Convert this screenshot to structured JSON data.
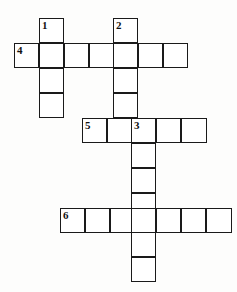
{
  "puzzle": {
    "title": "Crossword Grid",
    "type": "crossword",
    "canvas": {
      "width": 237,
      "height": 292
    },
    "cell_size": 24.8,
    "colors": {
      "grid_line": "#1a1a1a",
      "cell_fill": "#ffffff",
      "page_background": "#fdfdfc",
      "number_color": "#111111"
    },
    "entries": [
      {
        "number": "1",
        "direction": "down",
        "length": 4,
        "start": {
          "x": 39,
          "y": 18
        }
      },
      {
        "number": "2",
        "direction": "down",
        "length": 4,
        "start": {
          "x": 113,
          "y": 18
        }
      },
      {
        "number": "3",
        "direction": "down",
        "length": 7,
        "start": {
          "x": 131,
          "y": 118
        }
      },
      {
        "number": "4",
        "direction": "across",
        "length": 7,
        "start": {
          "x": 14,
          "y": 43
        }
      },
      {
        "number": "5",
        "direction": "across",
        "length": 5,
        "start": {
          "x": 82,
          "y": 118
        }
      },
      {
        "number": "6",
        "direction": "across",
        "length": 7,
        "start": {
          "x": 60,
          "y": 208
        }
      }
    ],
    "cells": [
      {
        "id": "c1",
        "x": 39,
        "y": 18,
        "w": 25,
        "h": 25,
        "number": "1"
      },
      {
        "id": "c2",
        "x": 39,
        "y": 43,
        "w": 25,
        "h": 25,
        "number": ""
      },
      {
        "id": "c3",
        "x": 39,
        "y": 68,
        "w": 25,
        "h": 25,
        "number": ""
      },
      {
        "id": "c4",
        "x": 39,
        "y": 93,
        "w": 25,
        "h": 25,
        "number": ""
      },
      {
        "id": "c5",
        "x": 113,
        "y": 18,
        "w": 25,
        "h": 25,
        "number": "2"
      },
      {
        "id": "c6",
        "x": 113,
        "y": 43,
        "w": 25,
        "h": 25,
        "number": ""
      },
      {
        "id": "c7",
        "x": 113,
        "y": 68,
        "w": 25,
        "h": 25,
        "number": ""
      },
      {
        "id": "c8",
        "x": 113,
        "y": 93,
        "w": 25,
        "h": 25,
        "number": ""
      },
      {
        "id": "c9",
        "x": 14,
        "y": 43,
        "w": 25,
        "h": 25,
        "number": "4"
      },
      {
        "id": "c10",
        "x": 64,
        "y": 43,
        "w": 25,
        "h": 25,
        "number": ""
      },
      {
        "id": "c11",
        "x": 89,
        "y": 43,
        "w": 25,
        "h": 25,
        "number": ""
      },
      {
        "id": "c12",
        "x": 138,
        "y": 43,
        "w": 25,
        "h": 25,
        "number": ""
      },
      {
        "id": "c13",
        "x": 163,
        "y": 43,
        "w": 25,
        "h": 25,
        "number": ""
      },
      {
        "id": "c14",
        "x": 82,
        "y": 118,
        "w": 25,
        "h": 25,
        "number": "5"
      },
      {
        "id": "c15",
        "x": 107,
        "y": 118,
        "w": 25,
        "h": 25,
        "number": ""
      },
      {
        "id": "c16",
        "x": 131,
        "y": 118,
        "w": 25,
        "h": 25,
        "number": "3"
      },
      {
        "id": "c17",
        "x": 156,
        "y": 118,
        "w": 25,
        "h": 25,
        "number": ""
      },
      {
        "id": "c18",
        "x": 181,
        "y": 118,
        "w": 26,
        "h": 25,
        "number": ""
      },
      {
        "id": "c19",
        "x": 131,
        "y": 143,
        "w": 25,
        "h": 25,
        "number": ""
      },
      {
        "id": "c20",
        "x": 131,
        "y": 168,
        "w": 25,
        "h": 25,
        "number": ""
      },
      {
        "id": "c21",
        "x": 131,
        "y": 193,
        "w": 25,
        "h": 25,
        "number": ""
      },
      {
        "id": "c22",
        "x": 131,
        "y": 232,
        "w": 25,
        "h": 25,
        "number": ""
      },
      {
        "id": "c23",
        "x": 131,
        "y": 257,
        "w": 25,
        "h": 25,
        "number": ""
      },
      {
        "id": "c24",
        "x": 60,
        "y": 208,
        "w": 25,
        "h": 25,
        "number": "6"
      },
      {
        "id": "c25",
        "x": 85,
        "y": 208,
        "w": 25,
        "h": 25,
        "number": ""
      },
      {
        "id": "c26",
        "x": 110,
        "y": 208,
        "w": 25,
        "h": 25,
        "number": ""
      },
      {
        "id": "c27",
        "x": 131,
        "y": 208,
        "w": 25,
        "h": 25,
        "number": ""
      },
      {
        "id": "c28",
        "x": 156,
        "y": 208,
        "w": 25,
        "h": 25,
        "number": ""
      },
      {
        "id": "c29",
        "x": 181,
        "y": 208,
        "w": 25,
        "h": 25,
        "number": ""
      },
      {
        "id": "c30",
        "x": 206,
        "y": 208,
        "w": 26,
        "h": 25,
        "number": ""
      }
    ]
  }
}
